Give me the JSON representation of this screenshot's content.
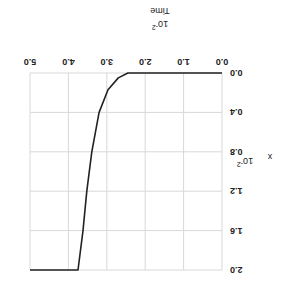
{
  "chart_data": {
    "type": "line",
    "title": "",
    "xlabel": "Time",
    "xlabel_multiplier": "10^-2",
    "ylabel": "x",
    "ylabel_multiplier": "10^-2",
    "xlim": [
      0.0,
      5.0
    ],
    "ylim": [
      0.0,
      2.0
    ],
    "x_ticks": [
      "0.0",
      "1.0",
      "2.0",
      "3.0",
      "4.0",
      "5.0"
    ],
    "y_ticks": [
      "0.0",
      "0.4",
      "0.8",
      "1.2",
      "1.6",
      "2.0"
    ],
    "grid": true,
    "rotation_deg": 180,
    "series": [
      {
        "name": "x",
        "color": "#222222",
        "x": [
          0.0,
          2.45,
          2.7,
          2.97,
          3.2,
          3.39,
          3.52,
          3.62,
          3.75,
          5.0
        ],
        "y": [
          0.0,
          0.0,
          0.05,
          0.17,
          0.4,
          0.8,
          1.2,
          1.6,
          2.0,
          2.0
        ]
      }
    ]
  },
  "labels": {
    "xlabel": "Time",
    "xexp_base": "10",
    "xexp_pow": "-2",
    "ylabel": "x",
    "yexp_base": "10",
    "yexp_pow": "-2"
  }
}
